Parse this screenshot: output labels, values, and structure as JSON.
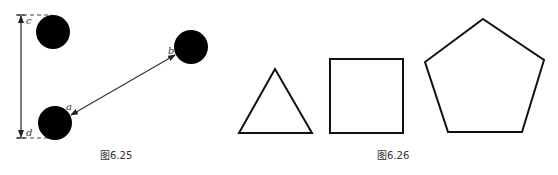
{
  "figure_625": {
    "caption": "图6.25",
    "labels": {
      "a": "a",
      "b": "b",
      "c": "c",
      "d": "d"
    },
    "circles": [
      {
        "name": "top-left-circle",
        "cx": 53,
        "cy": 32,
        "r": 17
      },
      {
        "name": "bottom-left-circle",
        "cx": 55,
        "cy": 123,
        "r": 17
      },
      {
        "name": "right-circle",
        "cx": 191,
        "cy": 47,
        "r": 17
      }
    ],
    "color": "#000000"
  },
  "figure_626": {
    "caption": "图6.26",
    "shapes": [
      "triangle",
      "square",
      "pentagon"
    ],
    "stroke_color": "#111111"
  }
}
